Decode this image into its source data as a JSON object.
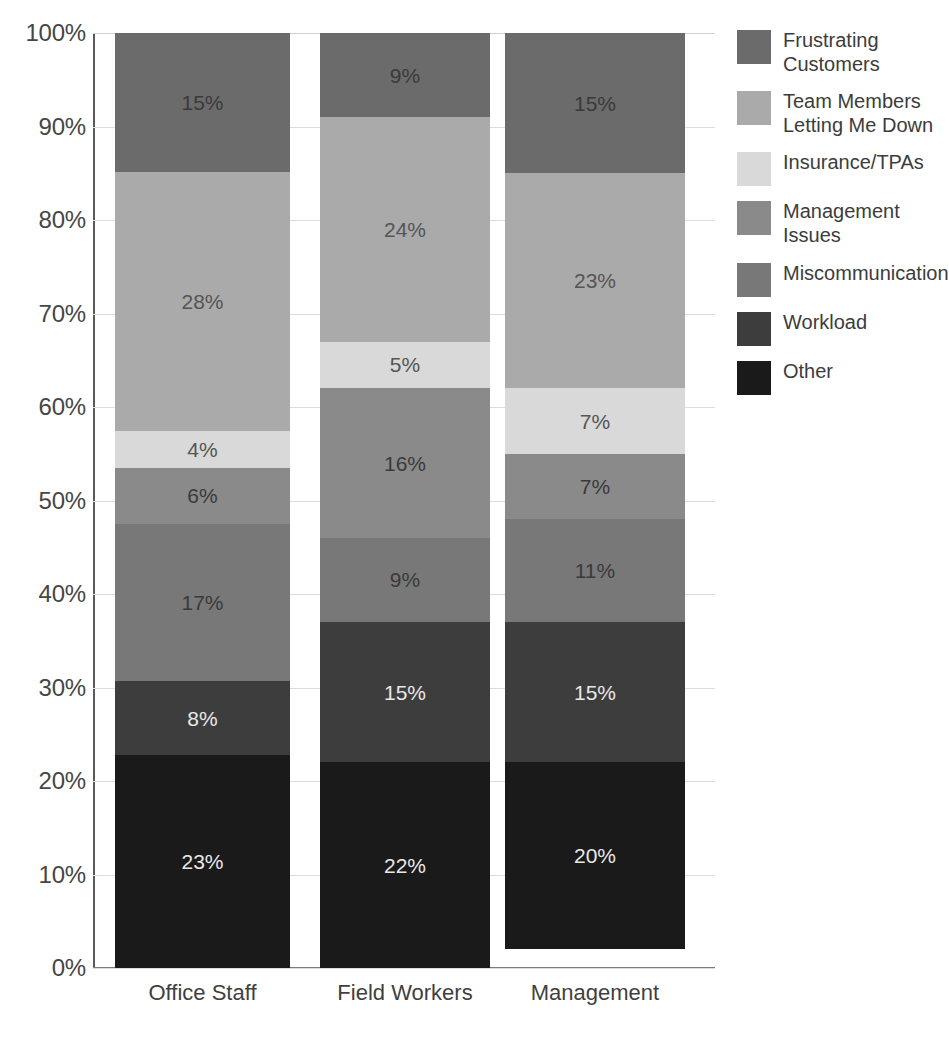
{
  "chart_data": {
    "type": "bar",
    "subtype": "stacked-100-percent",
    "title": "",
    "subtitle": "",
    "xlabel": "",
    "ylabel": "",
    "categories": [
      "Office Staff",
      "Field Workers",
      "Management"
    ],
    "ylim": [
      0,
      100
    ],
    "ytick_labels": [
      "0%",
      "10%",
      "20%",
      "30%",
      "40%",
      "50%",
      "60%",
      "70%",
      "80%",
      "90%",
      "100%"
    ],
    "ytick_values": [
      0,
      10,
      20,
      30,
      40,
      50,
      60,
      70,
      80,
      90,
      100
    ],
    "grid": true,
    "legend_position": "right",
    "stack_order_top_to_bottom": [
      "Frustrating Customers",
      "Team Members Letting Me Down",
      "Insurance/TPAs",
      "Management Issues",
      "Miscommunication",
      "Workload",
      "Other"
    ],
    "series": [
      {
        "name": "Frustrating Customers",
        "color": "#6b6b6b",
        "label_style": "dark",
        "values": [
          15,
          9,
          15
        ],
        "labels": [
          "15%",
          "9%",
          "15%"
        ]
      },
      {
        "name": "Team Members Letting Me Down",
        "color": "#aaaaaa",
        "label_style": "mid",
        "values": [
          28,
          24,
          23
        ],
        "labels": [
          "28%",
          "24%",
          "23%"
        ]
      },
      {
        "name": "Insurance/TPAs",
        "color": "#d9d9d9",
        "label_style": "mid",
        "values": [
          4,
          5,
          7
        ],
        "labels": [
          "4%",
          "5%",
          "7%"
        ]
      },
      {
        "name": "Management Issues",
        "color": "#8a8a8a",
        "label_style": "dark",
        "values": [
          6,
          16,
          7
        ],
        "labels": [
          "6%",
          "16%",
          "7%"
        ]
      },
      {
        "name": "Miscommunication",
        "color": "#787878",
        "label_style": "dark",
        "values": [
          17,
          9,
          11
        ],
        "labels": [
          "17%",
          "9%",
          "11%"
        ]
      },
      {
        "name": "Workload",
        "color": "#3d3d3d",
        "label_style": "light",
        "values": [
          8,
          15,
          15
        ],
        "labels": [
          "8%",
          "15%",
          "15%"
        ]
      },
      {
        "name": "Other",
        "color": "#1a1a1a",
        "label_style": "light",
        "values": [
          23,
          22,
          20
        ],
        "labels": [
          "23%",
          "22%",
          "20%"
        ]
      }
    ]
  },
  "legend": {
    "items": [
      {
        "label": "Frustrating\nCustomers",
        "color": "#6b6b6b"
      },
      {
        "label": "Team Members\nLetting Me Down",
        "color": "#aaaaaa"
      },
      {
        "label": "Insurance/TPAs",
        "color": "#d9d9d9"
      },
      {
        "label": "Management Issues",
        "color": "#8a8a8a"
      },
      {
        "label": "Miscommunication",
        "color": "#787878"
      },
      {
        "label": "Workload",
        "color": "#3d3d3d"
      },
      {
        "label": "Other",
        "color": "#1a1a1a"
      }
    ]
  },
  "layout": {
    "plot_left": 93,
    "plot_top": 33,
    "plot_width": 622,
    "plot_height": 935,
    "bars": [
      {
        "left": 22,
        "width": 175
      },
      {
        "left": 227,
        "width": 170
      },
      {
        "left": 412,
        "width": 180
      }
    ]
  }
}
